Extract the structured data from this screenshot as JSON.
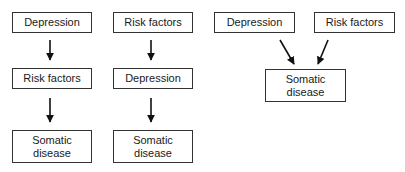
{
  "diagram": {
    "panels": [
      {
        "id": "model-a",
        "nodes": [
          {
            "label": "Depression"
          },
          {
            "label": "Risk factors"
          },
          {
            "label": "Somatic\ndisease"
          }
        ]
      },
      {
        "id": "model-b",
        "nodes": [
          {
            "label": "Risk factors"
          },
          {
            "label": "Depression"
          },
          {
            "label": "Somatic\ndisease"
          }
        ]
      },
      {
        "id": "model-c",
        "nodes": [
          {
            "label": "Depression"
          },
          {
            "label": "Risk factors"
          },
          {
            "label": "Somatic\ndisease"
          }
        ]
      }
    ],
    "edges": [
      {
        "panel": "model-a",
        "from": "Depression",
        "to": "Risk factors"
      },
      {
        "panel": "model-a",
        "from": "Risk factors",
        "to": "Somatic disease"
      },
      {
        "panel": "model-b",
        "from": "Risk factors",
        "to": "Depression"
      },
      {
        "panel": "model-b",
        "from": "Depression",
        "to": "Somatic disease"
      },
      {
        "panel": "model-c",
        "from": "Depression",
        "to": "Somatic disease"
      },
      {
        "panel": "model-c",
        "from": "Risk factors",
        "to": "Somatic disease"
      }
    ]
  }
}
